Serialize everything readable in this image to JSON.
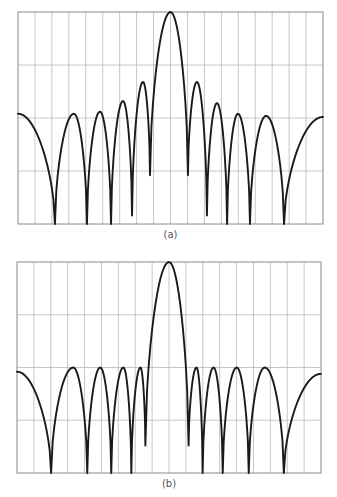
{
  "chart_data": [
    {
      "type": "line",
      "title": "",
      "caption": "(a)",
      "xlabel": "",
      "ylabel": "",
      "xlim": [
        -9,
        9
      ],
      "ylim": [
        0,
        1
      ],
      "grid": true,
      "x_divisions": 18,
      "y_divisions": 4,
      "tick_labels": false,
      "legend": "none",
      "series": [
        {
          "name": "pattern-a",
          "points": [
            [
              -9.0,
              0.52
            ],
            [
              -6.82,
              0.0
            ],
            [
              -5.7,
              0.52
            ],
            [
              -4.93,
              0.0
            ],
            [
              -4.16,
              0.53
            ],
            [
              -3.51,
              0.0
            ],
            [
              -2.8,
              0.58
            ],
            [
              -2.27,
              0.04
            ],
            [
              -1.62,
              0.67
            ],
            [
              -1.21,
              0.23
            ],
            [
              0.0,
              1.0
            ],
            [
              1.03,
              0.23
            ],
            [
              1.56,
              0.67
            ],
            [
              2.15,
              0.04
            ],
            [
              2.74,
              0.57
            ],
            [
              3.34,
              0.0
            ],
            [
              3.98,
              0.52
            ],
            [
              4.69,
              0.0
            ],
            [
              5.64,
              0.51
            ],
            [
              6.7,
              0.0
            ],
            [
              9.0,
              0.505
            ]
          ]
        }
      ]
    },
    {
      "type": "line",
      "title": "",
      "caption": "(b)",
      "xlabel": "",
      "ylabel": "",
      "xlim": [
        -9,
        9
      ],
      "ylim": [
        0,
        1
      ],
      "grid": true,
      "x_divisions": 18,
      "y_divisions": 4,
      "tick_labels": false,
      "legend": "none",
      "series": [
        {
          "name": "pattern-b",
          "points": [
            [
              -9.0,
              0.48
            ],
            [
              -6.98,
              0.0
            ],
            [
              -5.67,
              0.5
            ],
            [
              -4.84,
              0.0
            ],
            [
              -4.07,
              0.5
            ],
            [
              -3.42,
              0.0
            ],
            [
              -2.7,
              0.5
            ],
            [
              -2.23,
              0.0
            ],
            [
              -1.69,
              0.5
            ],
            [
              -1.4,
              0.13
            ],
            [
              0.0,
              1.0
            ],
            [
              1.16,
              0.13
            ],
            [
              1.63,
              0.5
            ],
            [
              1.99,
              0.0
            ],
            [
              2.64,
              0.5
            ],
            [
              3.18,
              0.0
            ],
            [
              4.01,
              0.5
            ],
            [
              4.72,
              0.0
            ],
            [
              5.67,
              0.5
            ],
            [
              6.8,
              0.0
            ],
            [
              9.0,
              0.47
            ]
          ]
        }
      ]
    }
  ],
  "colors": {
    "curve": "#1a1a1a",
    "grid": "#b8b8b8",
    "frame": "#8a8a8a",
    "caption": "#555555"
  }
}
